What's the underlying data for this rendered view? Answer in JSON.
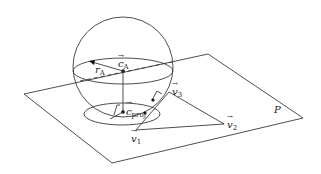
{
  "diagram": {
    "plane_label": "P",
    "labels": {
      "center": "c",
      "center_sub": "A",
      "radius": "r",
      "radius_sub": "A",
      "projection": "c",
      "projection_sub": "proj",
      "v1": "v",
      "v1_sub": "1",
      "v2": "v",
      "v2_sub": "2",
      "v3": "v",
      "v3_sub": "3",
      "arrow": "→"
    }
  }
}
